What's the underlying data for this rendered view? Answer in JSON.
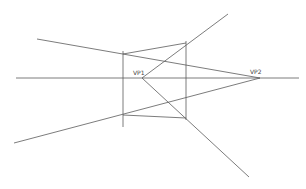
{
  "diagram": {
    "labels": {
      "vp1": "VP1",
      "vp2": "VP2"
    },
    "colors": {
      "line": "#5a5a5a",
      "background": "#ffffff"
    },
    "points": {
      "vp1": [
        142,
        78
      ],
      "vp2": [
        260,
        78
      ]
    },
    "lines": [
      {
        "name": "horizon-line",
        "from": [
          16,
          78
        ],
        "to": [
          299,
          78
        ]
      },
      {
        "name": "vp2-upper-line",
        "from": [
          37,
          39
        ],
        "to": [
          260,
          78
        ]
      },
      {
        "name": "vp2-lower-line",
        "from": [
          14,
          143
        ],
        "to": [
          260,
          78
        ]
      },
      {
        "name": "vp1-upper-line",
        "from": [
          142,
          78
        ],
        "to": [
          228,
          14
        ]
      },
      {
        "name": "vp1-lower-line",
        "from": [
          142,
          78
        ],
        "to": [
          249,
          177
        ]
      },
      {
        "name": "left-vertical-edge",
        "from": [
          123,
          51
        ],
        "to": [
          123,
          127
        ]
      },
      {
        "name": "right-vertical-edge",
        "from": [
          186,
          41
        ],
        "to": [
          186,
          120
        ]
      },
      {
        "name": "top-edge",
        "from": [
          123,
          54
        ],
        "to": [
          186,
          43
        ]
      },
      {
        "name": "bottom-edge",
        "from": [
          123,
          115
        ],
        "to": [
          186,
          118
        ]
      }
    ]
  }
}
